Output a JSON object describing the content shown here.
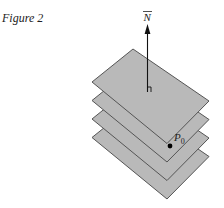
{
  "figure": {
    "caption": "Figure 2",
    "normal_label": "N",
    "point_label": "P",
    "point_subscript": "0",
    "plane_count": 4,
    "colors": {
      "plane_fill": "#b9b9b9",
      "plane_stroke": "#555555",
      "arrow": "#111111",
      "point": "#000000"
    }
  }
}
